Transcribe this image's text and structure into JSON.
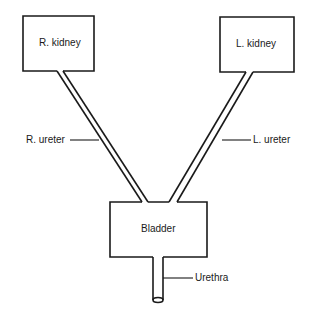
{
  "diagram": {
    "nodes": {
      "r_kidney": {
        "label": "R. kidney"
      },
      "l_kidney": {
        "label": "L. kidney"
      },
      "bladder": {
        "label": "Bladder"
      }
    },
    "labels": {
      "r_ureter": "R. ureter",
      "l_ureter": "L. ureter",
      "urethra": "Urethra"
    },
    "colors": {
      "stroke": "#1a1a1a",
      "background": "#ffffff"
    }
  }
}
